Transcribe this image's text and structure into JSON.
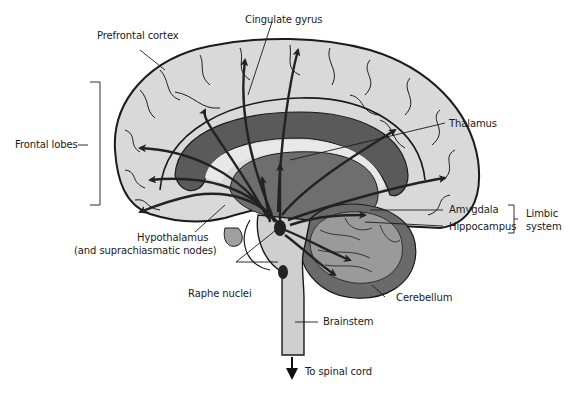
{
  "diagram": {
    "labels": {
      "cingulate_gyrus": "Cingulate gyrus",
      "prefrontal_cortex": "Prefrontal cortex",
      "frontal_lobes": "Frontal lobes",
      "thalamus": "Thalamus",
      "amygdala": "Amygdala",
      "hippocampus": "Hippocampus",
      "limbic_line1": "Limbic",
      "limbic_line2": "system",
      "hypothalamus_line1": "Hypothalamus",
      "hypothalamus_line2": "(and suprachiasmatic nodes)",
      "raphe_nuclei": "Raphe nuclei",
      "cerebellum": "Cerebellum",
      "brainstem": "Brainstem",
      "to_spinal_cord": "To spinal cord"
    },
    "colors": {
      "cortex": "#d9d9d9",
      "outline": "#1a1a1a",
      "corpus_callosum": "#5a5a5a",
      "thalamus": "#6e6e6e",
      "cerebellum_inner": "#9a9a9a",
      "cerebellum_outer": "#6a6a6a",
      "brainstem": "#cfcfcf",
      "pathway": "#222222"
    }
  }
}
